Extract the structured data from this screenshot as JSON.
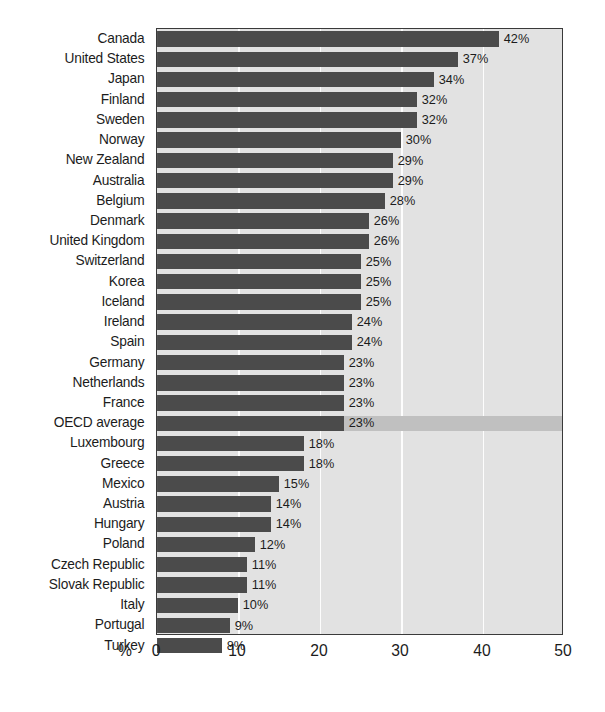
{
  "chart_data": {
    "type": "bar",
    "orientation": "horizontal",
    "title": "",
    "subtitle": "",
    "xlabel": "%",
    "ylabel": "",
    "xlim": [
      0,
      50
    ],
    "xticks": [
      0,
      10,
      20,
      30,
      40,
      50
    ],
    "grid": true,
    "legend": null,
    "value_suffix": "%",
    "highlight_category": "OECD average",
    "categories": [
      "Canada",
      "United States",
      "Japan",
      "Finland",
      "Sweden",
      "Norway",
      "New Zealand",
      "Australia",
      "Belgium",
      "Denmark",
      "United Kingdom",
      "Switzerland",
      "Korea",
      "Iceland",
      "Ireland",
      "Spain",
      "Germany",
      "Netherlands",
      "France",
      "OECD average",
      "Luxembourg",
      "Greece",
      "Mexico",
      "Austria",
      "Hungary",
      "Poland",
      "Czech Republic",
      "Slovak Republic",
      "Italy",
      "Portugal",
      "Turkey"
    ],
    "values": [
      42,
      37,
      34,
      32,
      32,
      30,
      29,
      29,
      28,
      26,
      26,
      25,
      25,
      25,
      24,
      24,
      23,
      23,
      23,
      23,
      18,
      18,
      15,
      14,
      14,
      12,
      11,
      11,
      10,
      9,
      8
    ],
    "value_labels": [
      "42%",
      "37%",
      "34%",
      "32%",
      "32%",
      "30%",
      "29%",
      "29%",
      "28%",
      "26%",
      "26%",
      "25%",
      "25%",
      "25%",
      "24%",
      "24%",
      "23%",
      "23%",
      "23%",
      "23%",
      "18%",
      "18%",
      "15%",
      "14%",
      "14%",
      "12%",
      "11%",
      "11%",
      "10%",
      "9%",
      "8%"
    ],
    "xtick_labels": [
      "0",
      "10",
      "20",
      "30",
      "40",
      "50"
    ],
    "colors": {
      "bar": "#4b4b4b",
      "plot_background": "#e2e2e2",
      "highlight_band": "#c0c0c0",
      "gridline": "#fdfdfd",
      "axis": "#3a3a3a",
      "text": "#1c1c1c"
    }
  }
}
